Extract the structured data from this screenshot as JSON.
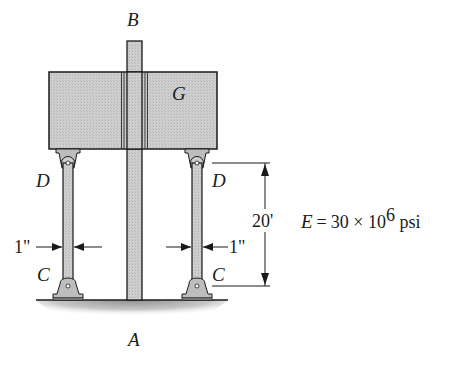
{
  "diagram": {
    "labels": {
      "top_post": "B",
      "bottom_post": "A",
      "block": "G",
      "left_top_pin": "D",
      "right_top_pin": "D",
      "left_bottom_pin": "C",
      "right_bottom_pin": "C"
    },
    "dimensions": {
      "left_width": "1\"",
      "right_width": "1\"",
      "height": "20'"
    },
    "material": {
      "prefix": "E = 30 × 10",
      "exponent": "6",
      "unit": " psi"
    },
    "colors": {
      "fill": "#c9c9c9",
      "outline": "#1a1a1a",
      "ground": "#9a9a9a"
    }
  }
}
